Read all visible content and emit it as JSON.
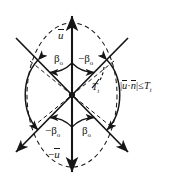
{
  "figure": {
    "name": "angle-constraint-diagram",
    "center_dot": true,
    "colors": {
      "ink": "#161616",
      "background": "#ffffff"
    },
    "labels": {
      "u_top": "u",
      "u_bottom_sign": "−",
      "u_bottom": "u",
      "beta_top_left": "β",
      "beta_top_left_sub": "o",
      "beta_top_right_sign": "−",
      "beta_top_right": "β",
      "beta_top_right_sub": "o",
      "beta_bottom_left_sign": "−",
      "beta_bottom_left": "β",
      "beta_bottom_left_sub": "o",
      "beta_bottom_right": "β",
      "beta_bottom_right_sub": "o",
      "T_t": "T",
      "T_t_sub": "t"
    },
    "inequality": {
      "bar_open": "|",
      "u": "u",
      "dot": "·",
      "n": "n",
      "bar_close": "|",
      "relation": "≤",
      "T": "T",
      "T_sub": "t"
    },
    "elements": {
      "dashed_ellipse": "dashed-ellipse",
      "vertical_axis": "vertical-double-arrow-axis",
      "diagonal_line_ne": "diagonal-line-ne-sw",
      "diagonal_line_nw": "diagonal-line-nw-se",
      "dashed_diagonal_ne": "dashed-diagonal-ne-sw",
      "dashed_diagonal_nw": "dashed-diagonal-nw-se",
      "arc_left": "solid-arc-left",
      "arc_right": "solid-arc-right",
      "angle_arc_top_left": "angle-arc-top-left",
      "angle_arc_top_right": "angle-arc-top-right",
      "angle_arc_bottom_left": "angle-arc-bottom-left",
      "angle_arc_bottom_right": "angle-arc-bottom-right",
      "angle_arc_Tt": "angle-arc-tt"
    }
  }
}
